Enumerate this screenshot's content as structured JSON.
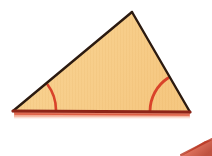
{
  "figure": {
    "background_color": "#ffffff",
    "width": 212,
    "height": 156,
    "shape_type": "triangle",
    "fill_color": "#f7cc87",
    "fill_highlight_color": "#fadda4",
    "stripe_color": "#f0bf74",
    "edge_dark_color": "#2b1a10",
    "base_line_color": "#8e2417",
    "base_shadow_color": "#e2644a",
    "arc_color": "#d9432a",
    "vertices": [
      {
        "name": "apex",
        "x": 132,
        "y": 12,
        "label": ""
      },
      {
        "name": "bottom-left",
        "x": 13,
        "y": 111,
        "label": ""
      },
      {
        "name": "bottom-right",
        "x": 190,
        "y": 112,
        "label": ""
      }
    ],
    "edges": [
      {
        "name": "left-edge",
        "from": "bottom-left",
        "to": "apex",
        "color": "#2b1a10",
        "width": 2.4
      },
      {
        "name": "right-edge",
        "from": "apex",
        "to": "bottom-right",
        "color": "#2b1a10",
        "width": 2.4
      },
      {
        "name": "base-edge",
        "from": "bottom-left",
        "to": "bottom-right",
        "color": "#8e2417",
        "width": 3.2
      }
    ],
    "angle_marks": [
      {
        "name": "left-base-angle",
        "vertex": "bottom-left",
        "radius": 43,
        "color": "#d9432a",
        "label": ""
      },
      {
        "name": "right-base-angle",
        "vertex": "bottom-right",
        "radius": 40,
        "color": "#d9432a",
        "label": ""
      }
    ],
    "cropped_shape": {
      "name": "adjacent-shape-fragment",
      "description": "diagonal red-orange edge of a neighbouring figure cut off at the bottom-right frame border",
      "color": "#d9543a"
    }
  },
  "caption": {
    "text": ""
  }
}
